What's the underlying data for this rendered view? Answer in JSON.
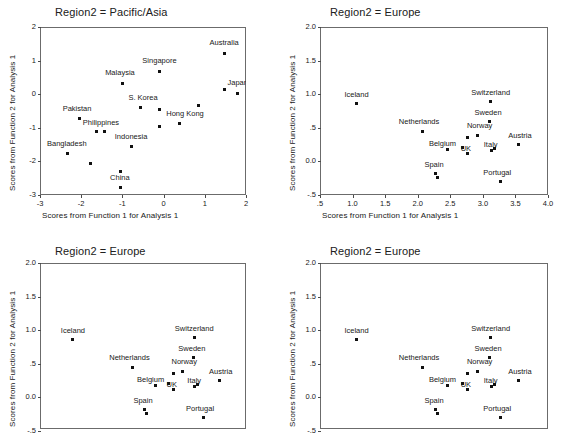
{
  "figure": {
    "background": "#ffffff",
    "point_color": "#111111",
    "frame_color": "#6b6b6b"
  },
  "chart_data": [
    {
      "type": "scatter",
      "title": "Region2 = Pacific/Asia",
      "xlabel": "Scores from Function 1 for Analysis 1",
      "ylabel": "Scores from Function 2 for Analysis 1",
      "xlim": [
        -3,
        2
      ],
      "ylim": [
        -3,
        2
      ],
      "xticks": [
        "-3",
        "-2",
        "-1",
        "0",
        "1",
        "2"
      ],
      "xtick_values": [
        -3,
        -2,
        -1,
        0,
        1,
        2
      ],
      "yticks": [
        "2",
        "1",
        "0",
        "-1",
        "-2",
        "-3"
      ],
      "ytick_values": [
        2,
        1,
        0,
        -1,
        -2,
        -3
      ],
      "grid": false,
      "legend": "none",
      "points": [
        {
          "label": "Australia",
          "x": 1.47,
          "y": 1.22,
          "lx": 1.47,
          "ly": 1.52,
          "anchor": "center"
        },
        {
          "label": "Japan",
          "x": 1.8,
          "y": 0.03,
          "lx": 1.8,
          "ly": 0.33,
          "anchor": "center"
        },
        {
          "label": "",
          "x": 1.47,
          "y": 0.13,
          "lx": 0,
          "ly": 0,
          "anchor": "none"
        },
        {
          "label": "Singapore",
          "x": -0.1,
          "y": 0.67,
          "lx": -0.1,
          "ly": 0.99,
          "anchor": "center"
        },
        {
          "label": "Malaysia",
          "x": -1.0,
          "y": 0.33,
          "lx": -1.06,
          "ly": 0.63,
          "anchor": "center"
        },
        {
          "label": "S. Korea",
          "x": -0.55,
          "y": -0.41,
          "lx": -0.5,
          "ly": -0.12,
          "anchor": "center"
        },
        {
          "label": "",
          "x": -0.1,
          "y": -0.45,
          "lx": 0,
          "ly": 0,
          "anchor": "none"
        },
        {
          "label": "",
          "x": 0.84,
          "y": -0.35,
          "lx": 0,
          "ly": 0,
          "anchor": "none"
        },
        {
          "label": "Hong Kong",
          "x": 0.39,
          "y": -0.87,
          "lx": 0.52,
          "ly": -0.6,
          "anchor": "center"
        },
        {
          "label": "",
          "x": -0.09,
          "y": -0.96,
          "lx": 0,
          "ly": 0,
          "anchor": "none"
        },
        {
          "label": "Pakistan",
          "x": -2.05,
          "y": -0.72,
          "lx": -2.1,
          "ly": -0.43,
          "anchor": "center"
        },
        {
          "label": "Philippines",
          "x": -1.62,
          "y": -1.12,
          "lx": -1.52,
          "ly": -0.85,
          "anchor": "center"
        },
        {
          "label": "",
          "x": -1.43,
          "y": -1.1,
          "lx": 0,
          "ly": 0,
          "anchor": "none"
        },
        {
          "label": "Indonesia",
          "x": -0.79,
          "y": -1.55,
          "lx": -0.79,
          "ly": -1.27,
          "anchor": "center"
        },
        {
          "label": "Bangladesh",
          "x": -2.33,
          "y": -1.77,
          "lx": -2.35,
          "ly": -1.49,
          "anchor": "center"
        },
        {
          "label": "",
          "x": -1.78,
          "y": -2.05,
          "lx": 0,
          "ly": 0,
          "anchor": "none"
        },
        {
          "label": "",
          "x": -1.05,
          "y": -2.29,
          "lx": 0,
          "ly": 0,
          "anchor": "none"
        },
        {
          "label": "China",
          "x": -1.04,
          "y": -2.79,
          "lx": -1.06,
          "ly": -2.5,
          "anchor": "center"
        }
      ]
    },
    {
      "type": "scatter",
      "title": "Region2 = Europe",
      "xlabel": "Scores from Function 1 for Analysis 1",
      "ylabel": "Scores from Function 2 for Analysis 1",
      "xlim": [
        0.5,
        4.0
      ],
      "ylim": [
        -0.5,
        2.0
      ],
      "xticks": [
        ".5",
        "1.0",
        "1.5",
        "2.0",
        "2.5",
        "3.0",
        "3.5",
        "4.0"
      ],
      "xtick_values": [
        0.5,
        1.0,
        1.5,
        2.0,
        2.5,
        3.0,
        3.5,
        4.0
      ],
      "yticks": [
        "2.0",
        "1.5",
        "1.0",
        ".5",
        "0.0",
        "-.5"
      ],
      "ytick_values": [
        2.0,
        1.5,
        1.0,
        0.5,
        0.0,
        -0.5
      ],
      "grid": false,
      "legend": "none",
      "points": [
        {
          "label": "Iceland",
          "x": 1.06,
          "y": 0.86,
          "lx": 1.06,
          "ly": 0.99,
          "anchor": "center"
        },
        {
          "label": "Switzerland",
          "x": 3.12,
          "y": 0.89,
          "lx": 3.12,
          "ly": 1.02,
          "anchor": "center"
        },
        {
          "label": "Sweden",
          "x": 3.1,
          "y": 0.59,
          "lx": 3.08,
          "ly": 0.72,
          "anchor": "center"
        },
        {
          "label": "Netherlands",
          "x": 2.07,
          "y": 0.45,
          "lx": 2.02,
          "ly": 0.58,
          "anchor": "center"
        },
        {
          "label": "Norway",
          "x": 2.92,
          "y": 0.39,
          "lx": 2.95,
          "ly": 0.52,
          "anchor": "center"
        },
        {
          "label": "",
          "x": 2.77,
          "y": 0.36,
          "lx": 0,
          "ly": 0,
          "anchor": "none"
        },
        {
          "label": "Austria",
          "x": 3.55,
          "y": 0.25,
          "lx": 3.57,
          "ly": 0.38,
          "anchor": "center"
        },
        {
          "label": "Belgium",
          "x": 2.46,
          "y": 0.18,
          "lx": 2.38,
          "ly": 0.26,
          "anchor": "center"
        },
        {
          "label": "UK",
          "x": 2.68,
          "y": 0.21,
          "lx": 2.74,
          "ly": 0.18,
          "anchor": "center"
        },
        {
          "label": "",
          "x": 2.77,
          "y": 0.12,
          "lx": 0,
          "ly": 0,
          "anchor": "none"
        },
        {
          "label": "Italy",
          "x": 3.13,
          "y": 0.16,
          "lx": 3.12,
          "ly": 0.25,
          "anchor": "center"
        },
        {
          "label": "",
          "x": 3.18,
          "y": 0.19,
          "lx": 0,
          "ly": 0,
          "anchor": "none"
        },
        {
          "label": "Spain",
          "x": 2.28,
          "y": -0.18,
          "lx": 2.25,
          "ly": -0.06,
          "anchor": "center"
        },
        {
          "label": "",
          "x": 2.31,
          "y": -0.24,
          "lx": 0,
          "ly": 0,
          "anchor": "none"
        },
        {
          "label": "Portugal",
          "x": 3.27,
          "y": -0.3,
          "lx": 3.22,
          "ly": -0.17,
          "anchor": "center"
        }
      ]
    },
    {
      "type": "scatter",
      "title": "Region2 = Europe",
      "xlabel": "",
      "ylabel": "Scores from Function 2 for Analysis 1",
      "xlim": [
        0.5,
        4.0
      ],
      "ylim": [
        -0.5,
        2.0
      ],
      "xticks": [],
      "xtick_values": [
        0.5,
        1.0,
        1.5,
        2.0,
        2.5,
        3.0,
        3.5,
        4.0
      ],
      "yticks": [
        "2.0",
        "1.5",
        "1.0",
        ".5",
        "0.0",
        "-.5"
      ],
      "ytick_values": [
        2.0,
        1.5,
        1.0,
        0.5,
        0.0,
        -0.5
      ],
      "grid": false,
      "legend": "none",
      "points": [
        {
          "label": "Iceland",
          "x": 1.06,
          "y": 0.86,
          "lx": 1.06,
          "ly": 0.99,
          "anchor": "center"
        },
        {
          "label": "Switzerland",
          "x": 3.12,
          "y": 0.89,
          "lx": 3.12,
          "ly": 1.02,
          "anchor": "center"
        },
        {
          "label": "Sweden",
          "x": 3.1,
          "y": 0.59,
          "lx": 3.08,
          "ly": 0.72,
          "anchor": "center"
        },
        {
          "label": "Netherlands",
          "x": 2.07,
          "y": 0.45,
          "lx": 2.02,
          "ly": 0.58,
          "anchor": "center"
        },
        {
          "label": "Norway",
          "x": 2.92,
          "y": 0.39,
          "lx": 2.95,
          "ly": 0.52,
          "anchor": "center"
        },
        {
          "label": "",
          "x": 2.77,
          "y": 0.36,
          "lx": 0,
          "ly": 0,
          "anchor": "none"
        },
        {
          "label": "Austria",
          "x": 3.55,
          "y": 0.25,
          "lx": 3.57,
          "ly": 0.38,
          "anchor": "center"
        },
        {
          "label": "Belgium",
          "x": 2.46,
          "y": 0.18,
          "lx": 2.38,
          "ly": 0.26,
          "anchor": "center"
        },
        {
          "label": "UK",
          "x": 2.68,
          "y": 0.21,
          "lx": 2.74,
          "ly": 0.18,
          "anchor": "center"
        },
        {
          "label": "",
          "x": 2.77,
          "y": 0.12,
          "lx": 0,
          "ly": 0,
          "anchor": "none"
        },
        {
          "label": "Italy",
          "x": 3.13,
          "y": 0.16,
          "lx": 3.12,
          "ly": 0.25,
          "anchor": "center"
        },
        {
          "label": "",
          "x": 3.18,
          "y": 0.19,
          "lx": 0,
          "ly": 0,
          "anchor": "none"
        },
        {
          "label": "Spain",
          "x": 2.28,
          "y": -0.18,
          "lx": 2.25,
          "ly": -0.06,
          "anchor": "center"
        },
        {
          "label": "",
          "x": 2.31,
          "y": -0.24,
          "lx": 0,
          "ly": 0,
          "anchor": "none"
        },
        {
          "label": "Portugal",
          "x": 3.27,
          "y": -0.3,
          "lx": 3.22,
          "ly": -0.17,
          "anchor": "center"
        }
      ]
    },
    {
      "type": "scatter",
      "title": "Region2 = Europe",
      "xlabel": "",
      "ylabel": "Scores from Function 2 for Analysis 1",
      "xlim": [
        0.5,
        4.0
      ],
      "ylim": [
        -0.5,
        2.0
      ],
      "xticks": [],
      "xtick_values": [
        0.5,
        1.0,
        1.5,
        2.0,
        2.5,
        3.0,
        3.5,
        4.0
      ],
      "yticks": [
        "2.0",
        "1.5",
        "1.0",
        ".5",
        "0.0",
        "-.5"
      ],
      "ytick_values": [
        2.0,
        1.5,
        1.0,
        0.5,
        0.0,
        -0.5
      ],
      "grid": false,
      "legend": "none",
      "points": [
        {
          "label": "Iceland",
          "x": 1.06,
          "y": 0.86,
          "lx": 1.06,
          "ly": 0.99,
          "anchor": "center"
        },
        {
          "label": "Switzerland",
          "x": 3.12,
          "y": 0.89,
          "lx": 3.12,
          "ly": 1.02,
          "anchor": "center"
        },
        {
          "label": "Sweden",
          "x": 3.1,
          "y": 0.59,
          "lx": 3.08,
          "ly": 0.72,
          "anchor": "center"
        },
        {
          "label": "Netherlands",
          "x": 2.07,
          "y": 0.45,
          "lx": 2.02,
          "ly": 0.58,
          "anchor": "center"
        },
        {
          "label": "Norway",
          "x": 2.92,
          "y": 0.39,
          "lx": 2.95,
          "ly": 0.52,
          "anchor": "center"
        },
        {
          "label": "",
          "x": 2.77,
          "y": 0.36,
          "lx": 0,
          "ly": 0,
          "anchor": "none"
        },
        {
          "label": "Austria",
          "x": 3.55,
          "y": 0.25,
          "lx": 3.57,
          "ly": 0.38,
          "anchor": "center"
        },
        {
          "label": "Belgium",
          "x": 2.46,
          "y": 0.18,
          "lx": 2.38,
          "ly": 0.26,
          "anchor": "center"
        },
        {
          "label": "UK",
          "x": 2.68,
          "y": 0.21,
          "lx": 2.74,
          "ly": 0.18,
          "anchor": "center"
        },
        {
          "label": "",
          "x": 2.77,
          "y": 0.12,
          "lx": 0,
          "ly": 0,
          "anchor": "none"
        },
        {
          "label": "Italy",
          "x": 3.13,
          "y": 0.16,
          "lx": 3.12,
          "ly": 0.25,
          "anchor": "center"
        },
        {
          "label": "",
          "x": 3.18,
          "y": 0.19,
          "lx": 0,
          "ly": 0,
          "anchor": "none"
        },
        {
          "label": "Spain",
          "x": 2.28,
          "y": -0.18,
          "lx": 2.25,
          "ly": -0.06,
          "anchor": "center"
        },
        {
          "label": "",
          "x": 2.31,
          "y": -0.24,
          "lx": 0,
          "ly": 0,
          "anchor": "none"
        },
        {
          "label": "Portugal",
          "x": 3.27,
          "y": -0.3,
          "lx": 3.22,
          "ly": -0.17,
          "anchor": "center"
        }
      ]
    }
  ],
  "layout": {
    "panels": [
      {
        "id": "panel-pacific-asia",
        "title_x": 55,
        "title_y": 6,
        "frame_x": 40,
        "frame_y": 27,
        "frame_w": 206,
        "frame_h": 168,
        "show_xaxis": true,
        "clip_h": 168
      },
      {
        "id": "panel-europe-1",
        "title_x": 330,
        "title_y": 6,
        "frame_x": 320,
        "frame_y": 27,
        "frame_w": 228,
        "frame_h": 168,
        "show_xaxis": true,
        "clip_h": 168
      },
      {
        "id": "panel-europe-2",
        "title_x": 55,
        "title_y": 245,
        "frame_x": 40,
        "frame_y": 263,
        "frame_w": 206,
        "frame_h": 168,
        "show_xaxis": false,
        "clip_h": 166
      },
      {
        "id": "panel-europe-3",
        "title_x": 330,
        "title_y": 245,
        "frame_x": 320,
        "frame_y": 263,
        "frame_w": 228,
        "frame_h": 168,
        "show_xaxis": false,
        "clip_h": 166
      }
    ]
  }
}
